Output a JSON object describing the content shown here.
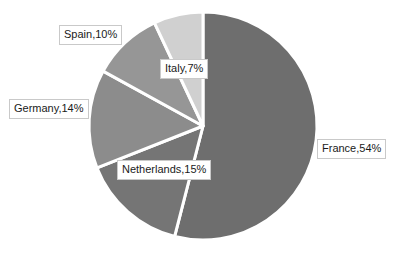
{
  "chart_data": {
    "type": "pie",
    "title": "",
    "subtitle": "",
    "xlabel": "",
    "ylabel": "",
    "grid": false,
    "legend": "none",
    "label_format": "{name},{percent}%",
    "start_angle_deg": 0,
    "direction": "clockwise",
    "categories": [
      "France",
      "Netherlands",
      "Germany",
      "Spain",
      "Italy"
    ],
    "values": [
      54,
      15,
      14,
      10,
      7
    ],
    "units": "percent",
    "slices": [
      {
        "name": "France",
        "percent": 54,
        "label": "France,54%",
        "color": "#6e6e6e",
        "start_deg": 0,
        "end_deg": 194.4
      },
      {
        "name": "Netherlands",
        "percent": 15,
        "label": "Netherlands,15%",
        "color": "#757575",
        "start_deg": 194.4,
        "end_deg": 248.4
      },
      {
        "name": "Germany",
        "percent": 14,
        "label": "Germany,14%",
        "color": "#8c8c8c",
        "start_deg": 248.4,
        "end_deg": 298.8
      },
      {
        "name": "Spain",
        "percent": 10,
        "label": "Spain,10%",
        "color": "#969696",
        "start_deg": 298.8,
        "end_deg": 334.8
      },
      {
        "name": "Italy",
        "percent": 7,
        "label": "Italy,7%",
        "color": "#d0d0d0",
        "start_deg": 334.8,
        "end_deg": 360
      }
    ],
    "geometry": {
      "center_x": 203,
      "center_y": 126,
      "radius": 114,
      "slice_gap_color": "#ffffff"
    },
    "style": {
      "background": "#ffffff",
      "label_text_color": "#1a1a1a",
      "label_border_color": "#c9c9c9",
      "label_background": "#ffffff"
    }
  }
}
